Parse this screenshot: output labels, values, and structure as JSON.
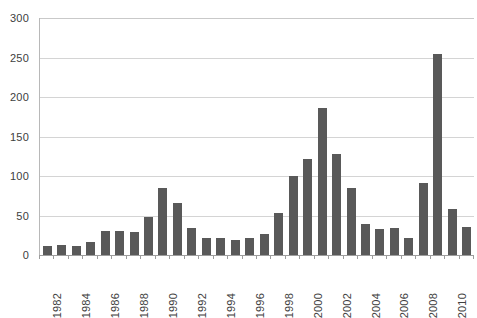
{
  "chart_data": {
    "type": "bar",
    "title": "",
    "subtitle": "",
    "xlabel": "",
    "ylabel": "",
    "ylim": [
      0,
      300
    ],
    "yticks": [
      0,
      50,
      100,
      150,
      200,
      250,
      300
    ],
    "ytick_labels": [
      "0",
      "50",
      "100",
      "150",
      "200",
      "250",
      "300"
    ],
    "grid": true,
    "grid_axis": "y",
    "legend": false,
    "legend_position": "none",
    "bar_color": "#595959",
    "gridline_color": "#d4d4d4",
    "axis_color": "#9d9d9d",
    "label_color": "#404040",
    "categories": [
      "1982",
      "1983",
      "1984",
      "1985",
      "1986",
      "1987",
      "1988",
      "1989",
      "1990",
      "1991",
      "1992",
      "1993",
      "1994",
      "1995",
      "1996",
      "1997",
      "1998",
      "1999",
      "2000",
      "2001",
      "2002",
      "2003",
      "2004",
      "2005",
      "2006",
      "2007",
      "2008",
      "2009",
      "2010",
      "2011"
    ],
    "visible_tick_labels": [
      "1982",
      "1984",
      "1986",
      "1988",
      "1990",
      "1992",
      "1994",
      "1996",
      "1998",
      "2000",
      "2002",
      "2004",
      "2006",
      "2008",
      "2010"
    ],
    "values": [
      12,
      13,
      12,
      16,
      30,
      31,
      29,
      48,
      85,
      66,
      34,
      21,
      22,
      19,
      22,
      27,
      53,
      100,
      121,
      186,
      128,
      85,
      39,
      33,
      34,
      21,
      91,
      255,
      58,
      36
    ],
    "series": [
      {
        "name": "series-1",
        "values": [
          12,
          13,
          12,
          16,
          30,
          31,
          29,
          48,
          85,
          66,
          34,
          21,
          22,
          19,
          22,
          27,
          53,
          100,
          121,
          186,
          128,
          85,
          39,
          33,
          34,
          21,
          91,
          255,
          58,
          36
        ]
      }
    ]
  }
}
